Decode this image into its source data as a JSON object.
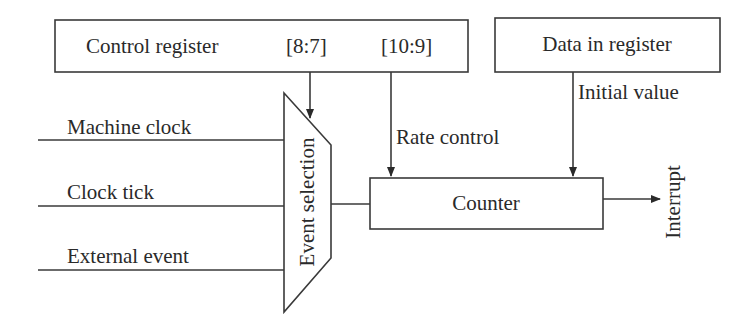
{
  "diagram": {
    "type": "timer-counter-block-diagram",
    "blocks": {
      "control_register": {
        "label": "Control register",
        "field_a": "[8:7]",
        "field_b": "[10:9]"
      },
      "data_in_register": {
        "label": "Data in register"
      },
      "event_selection": {
        "label": "Event selection"
      },
      "counter": {
        "label": "Counter"
      }
    },
    "inputs": [
      {
        "label": "Machine clock"
      },
      {
        "label": "Clock tick"
      },
      {
        "label": "External event"
      }
    ],
    "signals": {
      "rate_control": "Rate control",
      "initial_value": "Initial value",
      "interrupt": "Interrupt"
    },
    "colors": {
      "line": "#3a3a3a",
      "text": "#2a2a2a",
      "background": "#ffffff"
    }
  }
}
